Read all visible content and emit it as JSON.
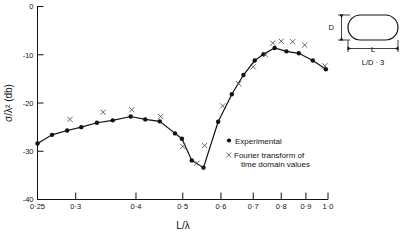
{
  "chart_data": {
    "type": "line",
    "title": "",
    "xlabel": "L/λ",
    "ylabel": "σ/λ² (db)",
    "xscale": "log",
    "xlim": [
      0.25,
      1.0
    ],
    "ylim": [
      -40,
      0
    ],
    "xticks": [
      0.25,
      0.3,
      0.4,
      0.5,
      0.6,
      0.7,
      0.8,
      0.9,
      1.0
    ],
    "xticklabels": [
      "0·25",
      "0·3",
      "0·4",
      "0·5",
      "0·6",
      "0·7",
      "0·8",
      "0·9",
      "1·0"
    ],
    "yticks": [
      0,
      -10,
      -20,
      -30,
      -40
    ],
    "yticklabels": [
      "0",
      "-10",
      "-20",
      "-30",
      "-40"
    ],
    "grid": false,
    "legend_position": "center-right",
    "series": [
      {
        "name": "Experimental",
        "marker": "filled-circle",
        "style": "line+markers",
        "points": [
          {
            "x": 0.25,
            "y": -28.4
          },
          {
            "x": 0.268,
            "y": -26.6
          },
          {
            "x": 0.288,
            "y": -25.7
          },
          {
            "x": 0.308,
            "y": -25.0
          },
          {
            "x": 0.332,
            "y": -24.1
          },
          {
            "x": 0.358,
            "y": -23.6
          },
          {
            "x": 0.39,
            "y": -22.8
          },
          {
            "x": 0.418,
            "y": -23.4
          },
          {
            "x": 0.448,
            "y": -23.8
          },
          {
            "x": 0.482,
            "y": -26.3
          },
          {
            "x": 0.498,
            "y": -27.4
          },
          {
            "x": 0.522,
            "y": -31.9
          },
          {
            "x": 0.552,
            "y": -33.4
          },
          {
            "x": 0.592,
            "y": -23.9
          },
          {
            "x": 0.632,
            "y": -18.2
          },
          {
            "x": 0.668,
            "y": -14.2
          },
          {
            "x": 0.705,
            "y": -11.2
          },
          {
            "x": 0.735,
            "y": -9.9
          },
          {
            "x": 0.775,
            "y": -8.6
          },
          {
            "x": 0.82,
            "y": -9.3
          },
          {
            "x": 0.87,
            "y": -9.7
          },
          {
            "x": 0.93,
            "y": -11.2
          },
          {
            "x": 0.99,
            "y": -13.0
          }
        ]
      },
      {
        "name": "Fourier transform of time domain values",
        "marker": "x",
        "style": "markers",
        "points": [
          {
            "x": 0.292,
            "y": -23.4
          },
          {
            "x": 0.342,
            "y": -21.9
          },
          {
            "x": 0.392,
            "y": -21.4
          },
          {
            "x": 0.45,
            "y": -22.8
          },
          {
            "x": 0.5,
            "y": -29.0
          },
          {
            "x": 0.535,
            "y": -32.5
          },
          {
            "x": 0.555,
            "y": -28.8
          },
          {
            "x": 0.605,
            "y": -20.6
          },
          {
            "x": 0.653,
            "y": -16.0
          },
          {
            "x": 0.7,
            "y": -12.5
          },
          {
            "x": 0.742,
            "y": -10.0
          },
          {
            "x": 0.768,
            "y": -7.6
          },
          {
            "x": 0.8,
            "y": -7.2
          },
          {
            "x": 0.845,
            "y": -7.3
          },
          {
            "x": 0.895,
            "y": -8.0
          },
          {
            "x": 0.985,
            "y": -12.3
          }
        ]
      }
    ]
  },
  "legend": {
    "items": [
      {
        "marker": "●",
        "label": "Experimental"
      },
      {
        "marker": "×",
        "label": "Fourier transform of"
      },
      {
        "marker": "",
        "label": "time domain values"
      }
    ]
  },
  "inset": {
    "shape_name": "capsule-body",
    "dim_vertical": "D",
    "dim_horizontal": "L",
    "ratio_label": "L/D · 3"
  },
  "axes": {
    "x_title": "L/λ",
    "y_title": "σ/λ² (db)"
  }
}
